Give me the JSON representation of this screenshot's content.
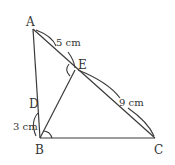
{
  "diagram": {
    "points": {
      "A": {
        "label": "A",
        "x": 33,
        "y": 29
      },
      "B": {
        "label": "B",
        "x": 40,
        "y": 138
      },
      "C": {
        "label": "C",
        "x": 155,
        "y": 138
      },
      "D": {
        "label": "D",
        "x": 38,
        "y": 111
      },
      "E": {
        "label": "E",
        "x": 75,
        "y": 70
      }
    },
    "segments": [
      "AB",
      "AC",
      "BC",
      "BE"
    ],
    "measurements": {
      "AE": "5 cm",
      "EC": "9 cm",
      "BD": "3 cm"
    },
    "angle_marks": [
      "angle AEB at E",
      "angle ABC at B"
    ],
    "stroke_color": "#3a3a3a",
    "text_color": "#333333"
  }
}
